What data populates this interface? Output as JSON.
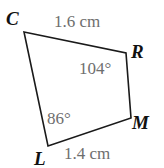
{
  "figure": {
    "type": "quadrilateral",
    "name": "quadrilateral-CRML",
    "background_color": "#ffffff",
    "stroke_color": "#1a1a1a",
    "vertex_label_color": "#111111",
    "measure_label_color": "#6e6e6e",
    "vertices": [
      {
        "id": "C",
        "label": "C",
        "x": 24,
        "y": 32
      },
      {
        "id": "R",
        "label": "R",
        "x": 126,
        "y": 53
      },
      {
        "id": "M",
        "label": "M",
        "x": 131,
        "y": 118
      },
      {
        "id": "L",
        "label": "L",
        "x": 48,
        "y": 146
      }
    ],
    "sides": [
      {
        "id": "CR",
        "from": "C",
        "to": "R",
        "length_label": "1.6 cm"
      },
      {
        "id": "RM",
        "from": "R",
        "to": "M",
        "length_label": ""
      },
      {
        "id": "ML",
        "from": "M",
        "to": "L",
        "length_label": ""
      },
      {
        "id": "LC",
        "from": "L",
        "to": "C",
        "length_label": ""
      },
      {
        "id": "LM",
        "from": "L",
        "to": "M",
        "length_label": "1.4 cm"
      }
    ],
    "angles": [
      {
        "at": "R",
        "label": "104°",
        "value": 104
      },
      {
        "at": "L",
        "label": "86°",
        "value": 86
      }
    ],
    "labels": {
      "vertex_C": "C",
      "vertex_R": "R",
      "vertex_M": "M",
      "vertex_L": "L",
      "side_top": "1.6 cm",
      "side_bottom": "1.4 cm",
      "angle_R": "104°",
      "angle_L": "86°"
    }
  }
}
